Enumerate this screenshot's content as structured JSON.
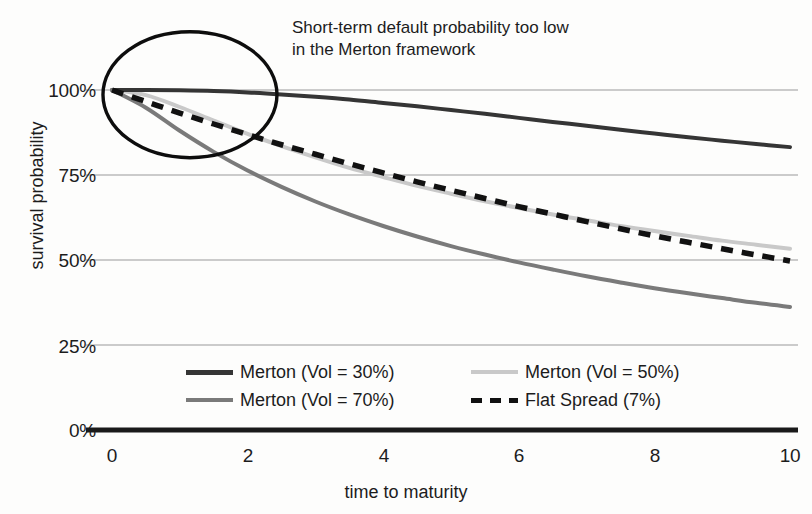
{
  "chart_data": {
    "type": "line",
    "title": "",
    "subtitle": "",
    "xlabel": "time to maturity",
    "ylabel": "survival probability",
    "xlim": [
      0,
      10
    ],
    "ylim": [
      0,
      1.0
    ],
    "grid": true,
    "grid_axis": "y",
    "legend_position": "inside-lower-center",
    "x_ticks": [
      "0",
      "2",
      "4",
      "6",
      "8",
      "10"
    ],
    "x_tick_values": [
      0,
      2,
      4,
      6,
      8,
      10
    ],
    "y_ticks": [
      "0%",
      "25%",
      "50%",
      "75%",
      "100%"
    ],
    "y_tick_values": [
      0,
      0.25,
      0.5,
      0.75,
      1.0
    ],
    "x": [
      0,
      0.5,
      1,
      1.5,
      2,
      2.5,
      3,
      3.5,
      4,
      4.5,
      5,
      5.5,
      6,
      6.5,
      7,
      7.5,
      8,
      8.5,
      9,
      9.5,
      10
    ],
    "series": [
      {
        "name": "Merton (Vol = 30%)",
        "color": "#353535",
        "style": "solid",
        "width": 4.0,
        "values": [
          1.0,
          1.0,
          0.999,
          0.997,
          0.993,
          0.987,
          0.98,
          0.972,
          0.962,
          0.952,
          0.941,
          0.93,
          0.918,
          0.906,
          0.895,
          0.883,
          0.872,
          0.861,
          0.851,
          0.841,
          0.832
        ]
      },
      {
        "name": "Merton (Vol = 50%)",
        "color": "#c9c9c9",
        "style": "solid",
        "width": 4.0,
        "values": [
          1.0,
          0.985,
          0.95,
          0.91,
          0.871,
          0.835,
          0.802,
          0.771,
          0.744,
          0.718,
          0.695,
          0.673,
          0.653,
          0.634,
          0.617,
          0.6,
          0.585,
          0.571,
          0.557,
          0.545,
          0.533
        ]
      },
      {
        "name": "Merton (Vol = 70%)",
        "color": "#7a7a7a",
        "style": "solid",
        "width": 4.0,
        "values": [
          1.0,
          0.948,
          0.88,
          0.818,
          0.763,
          0.715,
          0.672,
          0.634,
          0.6,
          0.569,
          0.541,
          0.516,
          0.493,
          0.472,
          0.452,
          0.434,
          0.417,
          0.402,
          0.388,
          0.374,
          0.362
        ]
      },
      {
        "name": "Flat Spread (7%)",
        "color": "#111111",
        "style": "dashed",
        "width": 5.5,
        "values": [
          1.0,
          0.966,
          0.932,
          0.9,
          0.869,
          0.839,
          0.811,
          0.783,
          0.756,
          0.73,
          0.705,
          0.681,
          0.657,
          0.635,
          0.613,
          0.592,
          0.571,
          0.552,
          0.533,
          0.515,
          0.497
        ]
      }
    ],
    "annotations": [
      {
        "name": "short-term-default-callout",
        "text_lines": [
          "Short-term default probability too low",
          "in the Merton framework"
        ],
        "shape": "ellipse",
        "shape_center_x": 1.15,
        "shape_center_y": 0.995
      }
    ]
  },
  "axis": {
    "ylabel": "survival probability",
    "xlabel": "time to maturity",
    "y_ticks": [
      "100%",
      "75%",
      "50%",
      "25%",
      "0%"
    ],
    "x_ticks": [
      "0",
      "2",
      "4",
      "6",
      "8",
      "10"
    ]
  },
  "annotation": {
    "line1": "Short-term default probability too low",
    "line2": "in the Merton framework"
  },
  "legend": {
    "entries": [
      {
        "label": "Merton (Vol = 30%)",
        "color": "#353535",
        "style": "solid"
      },
      {
        "label": "Merton (Vol = 50%)",
        "color": "#c9c9c9",
        "style": "solid"
      },
      {
        "label": "Merton (Vol = 70%)",
        "color": "#7a7a7a",
        "style": "solid"
      },
      {
        "label": "Flat Spread (7%)",
        "color": "#111111",
        "style": "dashed"
      }
    ]
  },
  "colors": {
    "grid": "#9a9a9a",
    "baseline_axis": "#1a1a1a",
    "text": "#1c1c1c",
    "background": "#fdfdfc"
  }
}
